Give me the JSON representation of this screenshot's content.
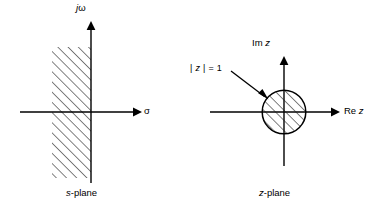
{
  "figure": {
    "background_color": "#ffffff",
    "ink_color": "#000000",
    "width": 373,
    "height": 212
  },
  "s_plane": {
    "caption": "s-plane",
    "caption_italic_prefix": "s",
    "caption_rest": "-plane",
    "vertical_axis_label": "jω",
    "vertical_axis_italic_prefix": "j",
    "vertical_axis_rest": "ω",
    "horizontal_axis_label": "σ",
    "shaded_region": "left half plane",
    "hatch_direction": "lower-left to upper-right",
    "region_bounds": {
      "x_left": 52,
      "x_right": 91,
      "y_top": 47,
      "y_bottom": 178
    },
    "origin": {
      "x": 91,
      "y": 112
    }
  },
  "z_plane": {
    "caption": "z-plane",
    "caption_italic_prefix": "z",
    "caption_rest": "-plane",
    "vertical_axis_label": "Im z",
    "vertical_axis_text": "Im",
    "vertical_axis_italic": "z",
    "horizontal_axis_label": "Re z",
    "horizontal_axis_text": "Re",
    "horizontal_axis_italic": "z",
    "circle_annotation": "| z | = 1",
    "circle_annotation_pre": "|",
    "circle_annotation_italic": "z",
    "circle_annotation_post": "| = 1",
    "shaded_region": "unit disk",
    "hatch_direction": "lower-left to upper-right",
    "circle": {
      "cx": 284,
      "cy": 112,
      "r": 22
    },
    "origin": {
      "x": 284,
      "y": 112
    }
  }
}
